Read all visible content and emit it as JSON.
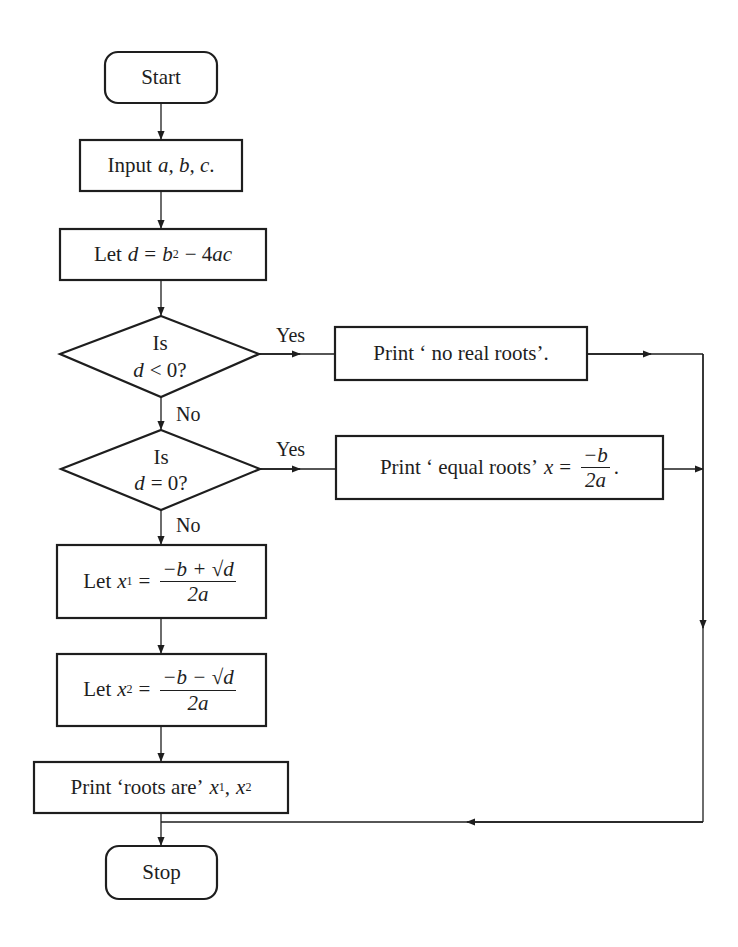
{
  "flowchart": {
    "nodes": {
      "start": {
        "label": "Start",
        "shape": "terminal"
      },
      "input": {
        "prefix": "Input",
        "vars": "a, b, c",
        "suffix": "."
      },
      "discriminant": {
        "prefix": "Let",
        "var": "d",
        "eq": "=",
        "b": "b",
        "exp": "2",
        "rest": "− 4",
        "ac": "ac"
      },
      "decision_neg": {
        "line1": "Is",
        "var": "d",
        "rest": "< 0?"
      },
      "decision_zero": {
        "line1": "Is",
        "var": "d",
        "rest": "= 0?"
      },
      "print_no_real": {
        "label": "Print ‘ no real roots’."
      },
      "print_equal": {
        "prefix": "Print ‘ equal roots’",
        "var": "x",
        "eq": "=",
        "num": "−b",
        "den": "2a",
        "suffix": "."
      },
      "root1": {
        "prefix": "Let",
        "var": "x",
        "sub": "1",
        "eq": "=",
        "num": "−b + √d",
        "den": "2a"
      },
      "root2": {
        "prefix": "Let",
        "var": "x",
        "sub": "2",
        "eq": "=",
        "num": "−b − √d",
        "den": "2a"
      },
      "print_roots": {
        "prefix": "Print ‘roots are’",
        "var1": "x",
        "sub1": "1",
        "sep": ",",
        "var2": "x",
        "sub2": "2"
      },
      "stop": {
        "label": "Stop",
        "shape": "terminal"
      }
    },
    "edge_labels": {
      "neg_yes": "Yes",
      "neg_no": "No",
      "zero_yes": "Yes",
      "zero_no": "No"
    },
    "colors": {
      "stroke": "#1e1e1e",
      "background": "#ffffff"
    }
  }
}
